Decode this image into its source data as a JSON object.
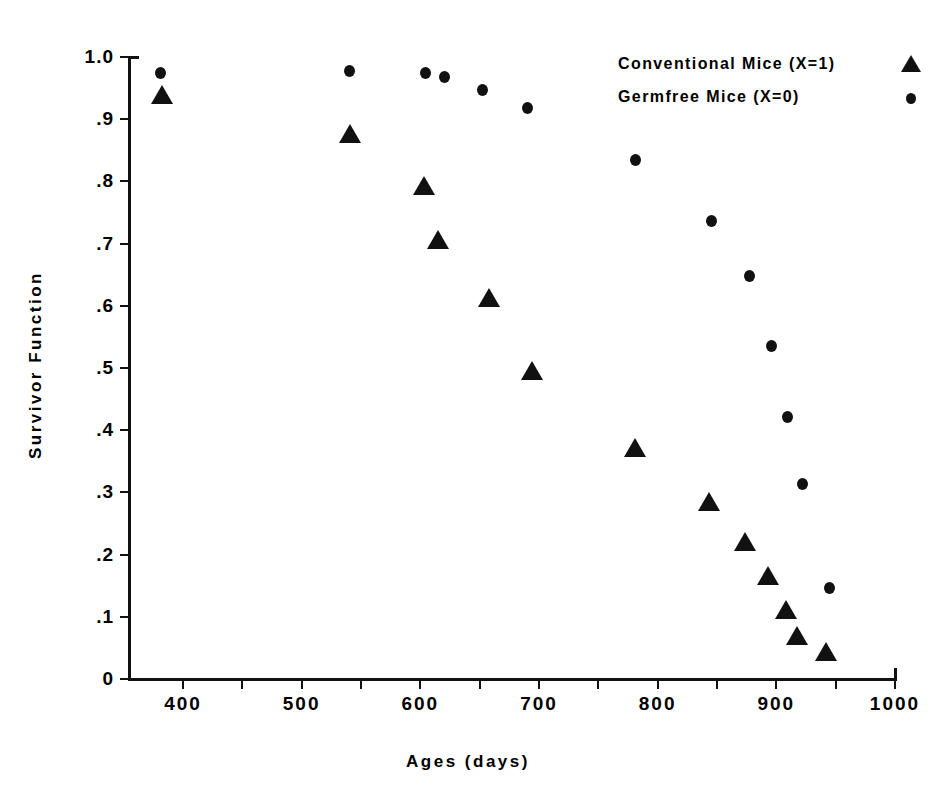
{
  "chart_data": {
    "type": "scatter",
    "title": "",
    "xlabel": "Ages (days)",
    "ylabel": "Survivor Function",
    "xlim": [
      360,
      1000
    ],
    "ylim": [
      0,
      1.0
    ],
    "grid": false,
    "legend_position": "top-right",
    "x_ticks": [
      400,
      450,
      500,
      550,
      600,
      650,
      700,
      750,
      800,
      850,
      900,
      950,
      1000
    ],
    "x_tick_labels": [
      {
        "value": 400,
        "label": "400"
      },
      {
        "value": 450,
        "label": ""
      },
      {
        "value": 500,
        "label": "500"
      },
      {
        "value": 550,
        "label": ""
      },
      {
        "value": 600,
        "label": "600"
      },
      {
        "value": 650,
        "label": ""
      },
      {
        "value": 700,
        "label": "700"
      },
      {
        "value": 750,
        "label": ""
      },
      {
        "value": 800,
        "label": "800"
      },
      {
        "value": 850,
        "label": ""
      },
      {
        "value": 900,
        "label": "900"
      },
      {
        "value": 950,
        "label": ""
      },
      {
        "value": 1000,
        "label": "1000"
      }
    ],
    "y_ticks": [
      0,
      0.1,
      0.2,
      0.3,
      0.4,
      0.5,
      0.6,
      0.7,
      0.8,
      0.9,
      1.0
    ],
    "y_tick_labels": [
      "0",
      ".1",
      ".2",
      ".3",
      ".4",
      ".5",
      ".6",
      ".7",
      ".8",
      ".9",
      "1.0"
    ],
    "series": [
      {
        "name": "Conventional Mice (X=1)",
        "marker": "triangle",
        "color": "#111111",
        "points": [
          {
            "x": 382,
            "y": 0.939
          },
          {
            "x": 541,
            "y": 0.876
          },
          {
            "x": 603,
            "y": 0.792
          },
          {
            "x": 615,
            "y": 0.706
          },
          {
            "x": 658,
            "y": 0.612
          },
          {
            "x": 694,
            "y": 0.495
          },
          {
            "x": 781,
            "y": 0.371
          },
          {
            "x": 843,
            "y": 0.285
          },
          {
            "x": 874,
            "y": 0.221
          },
          {
            "x": 893,
            "y": 0.166
          },
          {
            "x": 908,
            "y": 0.111
          },
          {
            "x": 917,
            "y": 0.069
          },
          {
            "x": 942,
            "y": 0.043
          }
        ]
      },
      {
        "name": "Germfree Mice (X=0)",
        "marker": "circle",
        "color": "#111111",
        "points": [
          {
            "x": 381,
            "y": 0.975
          },
          {
            "x": 540,
            "y": 0.978
          },
          {
            "x": 604,
            "y": 0.975
          },
          {
            "x": 620,
            "y": 0.968
          },
          {
            "x": 652,
            "y": 0.947
          },
          {
            "x": 690,
            "y": 0.918
          },
          {
            "x": 781,
            "y": 0.834
          },
          {
            "x": 845,
            "y": 0.736
          },
          {
            "x": 877,
            "y": 0.648
          },
          {
            "x": 896,
            "y": 0.535
          },
          {
            "x": 909,
            "y": 0.421
          },
          {
            "x": 922,
            "y": 0.313
          },
          {
            "x": 945,
            "y": 0.147
          }
        ]
      }
    ]
  },
  "legend": {
    "entries": [
      {
        "label": "Conventional Mice (X=1)",
        "marker": "triangle"
      },
      {
        "label": "Germfree Mice (X=0)",
        "marker": "circle"
      }
    ]
  },
  "axes": {
    "x_title": "Ages (days)",
    "y_title": "Survivor Function"
  }
}
